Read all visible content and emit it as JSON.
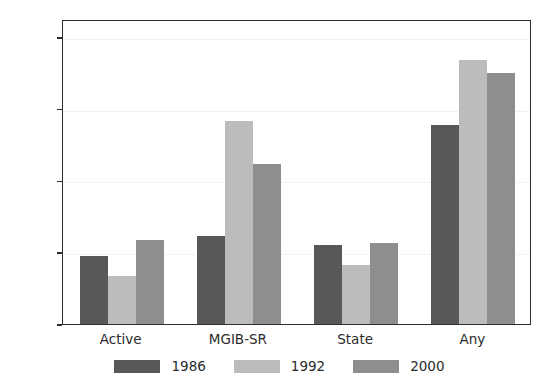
{
  "chart_data": {
    "type": "bar",
    "title": "",
    "xlabel": "",
    "ylabel": "",
    "categories": [
      "Active",
      "MGIB-SR",
      "State",
      "Any"
    ],
    "series": [
      {
        "name": "1986",
        "color": "#585858",
        "values": [
          0.19,
          0.245,
          0.22,
          0.555
        ]
      },
      {
        "name": "1992",
        "color": "#bcbcbc",
        "values": [
          0.135,
          0.565,
          0.165,
          0.735
        ]
      },
      {
        "name": "2000",
        "color": "#8e8e8e",
        "values": [
          0.235,
          0.445,
          0.225,
          0.7
        ]
      }
    ],
    "ylim": [
      0.0,
      0.85
    ],
    "yticks": [
      0.0,
      0.2,
      0.4,
      0.6,
      0.8
    ],
    "ytick_labels": [
      "0.0",
      "0.2",
      "0.4",
      "0.6",
      "0.8"
    ],
    "grid": true,
    "legend_position": "bottom"
  }
}
